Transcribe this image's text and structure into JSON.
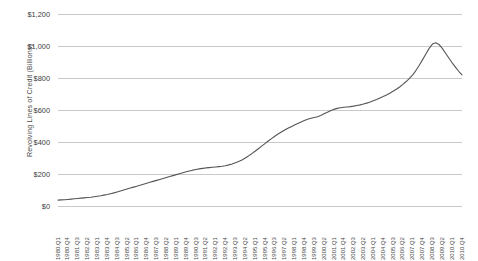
{
  "chart_data": {
    "type": "line",
    "title": "",
    "xlabel": "",
    "ylabel": "Revolving Lines of Credit (Billions)",
    "ylim": [
      0,
      1200
    ],
    "y_ticks": [
      0,
      200,
      400,
      600,
      800,
      1000,
      1200
    ],
    "y_tick_labels": [
      "$0",
      "$200",
      "$400",
      "$600",
      "$800",
      "$1,000",
      "$1,200"
    ],
    "grid": "horizontal",
    "legend": "none",
    "line_color": "#555555",
    "x_tick_labels": [
      "1980.Q1",
      "1980.Q4",
      "1981.Q3",
      "1982.Q2",
      "1983.Q1",
      "1983.Q4",
      "1984.Q3",
      "1985.Q2",
      "1986.Q1",
      "1986.Q4",
      "1987.Q3",
      "1988.Q2",
      "1989.Q1",
      "1989.Q4",
      "1990.Q3",
      "1991.Q2",
      "1992.Q1",
      "1992.Q4",
      "1993.Q3",
      "1994.Q2",
      "1995.Q1",
      "1995.Q4",
      "1996.Q3",
      "1997.Q2",
      "1998.Q1",
      "1998.Q4",
      "1999.Q3",
      "2000.Q2",
      "2001.Q1",
      "2001.Q4",
      "2002.Q3",
      "2003.Q2",
      "2004.Q1",
      "2004.Q4",
      "2005.Q3",
      "2006.Q2",
      "2007.Q1",
      "2007.Q4",
      "2008.Q3",
      "2009.Q2",
      "2010.Q1",
      "2010.Q4"
    ],
    "x": [
      "1980.Q1",
      "1980.Q2",
      "1980.Q3",
      "1980.Q4",
      "1981.Q1",
      "1981.Q2",
      "1981.Q3",
      "1981.Q4",
      "1982.Q1",
      "1982.Q2",
      "1982.Q3",
      "1982.Q4",
      "1983.Q1",
      "1983.Q2",
      "1983.Q3",
      "1983.Q4",
      "1984.Q1",
      "1984.Q2",
      "1984.Q3",
      "1984.Q4",
      "1985.Q1",
      "1985.Q2",
      "1985.Q3",
      "1985.Q4",
      "1986.Q1",
      "1986.Q2",
      "1986.Q3",
      "1986.Q4",
      "1987.Q1",
      "1987.Q2",
      "1987.Q3",
      "1987.Q4",
      "1988.Q1",
      "1988.Q2",
      "1988.Q3",
      "1988.Q4",
      "1989.Q1",
      "1989.Q2",
      "1989.Q3",
      "1989.Q4",
      "1990.Q1",
      "1990.Q2",
      "1990.Q3",
      "1990.Q4",
      "1991.Q1",
      "1991.Q2",
      "1991.Q3",
      "1991.Q4",
      "1992.Q1",
      "1992.Q2",
      "1992.Q3",
      "1992.Q4",
      "1993.Q1",
      "1993.Q2",
      "1993.Q3",
      "1993.Q4",
      "1994.Q1",
      "1994.Q2",
      "1994.Q3",
      "1994.Q4",
      "1995.Q1",
      "1995.Q2",
      "1995.Q3",
      "1995.Q4",
      "1996.Q1",
      "1996.Q2",
      "1996.Q3",
      "1996.Q4",
      "1997.Q1",
      "1997.Q2",
      "1997.Q3",
      "1997.Q4",
      "1998.Q1",
      "1998.Q2",
      "1998.Q3",
      "1998.Q4",
      "1999.Q1",
      "1999.Q2",
      "1999.Q3",
      "1999.Q4",
      "2000.Q1",
      "2000.Q2",
      "2000.Q3",
      "2000.Q4",
      "2001.Q1",
      "2001.Q2",
      "2001.Q3",
      "2001.Q4",
      "2002.Q1",
      "2002.Q2",
      "2002.Q3",
      "2002.Q4",
      "2003.Q1",
      "2003.Q2",
      "2003.Q3",
      "2003.Q4",
      "2004.Q1",
      "2004.Q2",
      "2004.Q3",
      "2004.Q4",
      "2005.Q1",
      "2005.Q2",
      "2005.Q3",
      "2005.Q4",
      "2006.Q1",
      "2006.Q2",
      "2006.Q3",
      "2006.Q4",
      "2007.Q1",
      "2007.Q2",
      "2007.Q3",
      "2007.Q4",
      "2008.Q1",
      "2008.Q2",
      "2008.Q3",
      "2008.Q4",
      "2009.Q1",
      "2009.Q2",
      "2009.Q3",
      "2009.Q4",
      "2010.Q1",
      "2010.Q2",
      "2010.Q3",
      "2010.Q4"
    ],
    "values": [
      37,
      38,
      39,
      41,
      43,
      45,
      47,
      49,
      51,
      53,
      55,
      58,
      61,
      64,
      68,
      72,
      77,
      82,
      88,
      94,
      100,
      106,
      112,
      118,
      124,
      130,
      136,
      142,
      148,
      154,
      160,
      166,
      172,
      178,
      184,
      190,
      196,
      202,
      208,
      214,
      219,
      224,
      228,
      232,
      235,
      238,
      240,
      242,
      244,
      246,
      248,
      252,
      257,
      263,
      270,
      278,
      288,
      300,
      313,
      327,
      342,
      358,
      374,
      390,
      406,
      421,
      436,
      450,
      463,
      475,
      486,
      496,
      506,
      516,
      525,
      534,
      542,
      548,
      553,
      558,
      566,
      576,
      586,
      596,
      604,
      610,
      614,
      617,
      619,
      621,
      624,
      628,
      632,
      637,
      643,
      650,
      658,
      666,
      675,
      684,
      694,
      705,
      717,
      730,
      744,
      760,
      778,
      798,
      820,
      848,
      880,
      915,
      950,
      985,
      1012,
      1020,
      1010,
      985,
      955,
      925,
      895,
      868,
      842,
      820
    ]
  }
}
